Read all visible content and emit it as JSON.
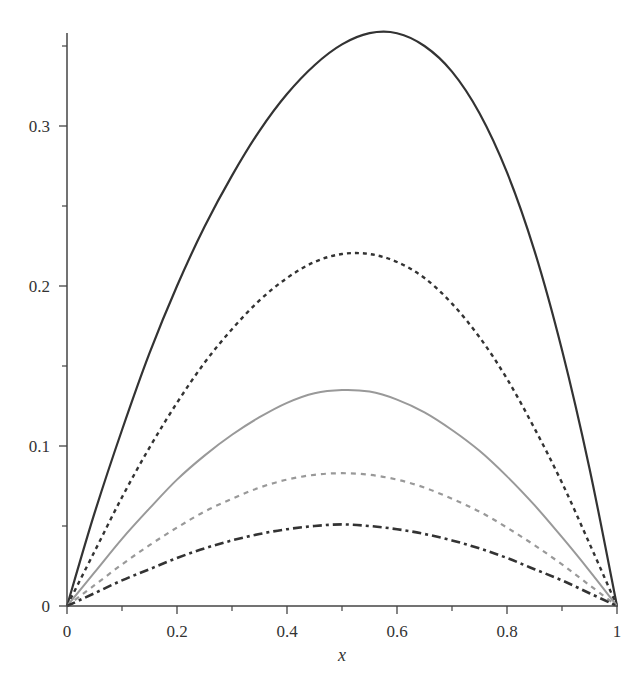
{
  "chart_data": {
    "type": "line",
    "title": "",
    "xlabel": "x",
    "ylabel": "",
    "xlim": [
      0,
      1
    ],
    "ylim": [
      0,
      0.36
    ],
    "grid": false,
    "legend": null,
    "x_ticks": [
      0,
      0.2,
      0.4,
      0.6,
      0.8,
      1
    ],
    "x_tick_labels": [
      "0",
      "0.2",
      "0.4",
      "0.6",
      "0.8",
      "1"
    ],
    "x_minor_ticks": [
      0.1,
      0.3,
      0.5,
      0.7,
      0.9
    ],
    "y_ticks": [
      0,
      0.1,
      0.2,
      0.3
    ],
    "y_tick_labels": [
      "0",
      "0.1",
      "0.2",
      "0.3"
    ],
    "y_minor_ticks": [
      0.05,
      0.15,
      0.25,
      0.35
    ],
    "x": [
      0,
      0.05,
      0.1,
      0.15,
      0.2,
      0.25,
      0.3,
      0.35,
      0.4,
      0.45,
      0.5,
      0.55,
      0.6,
      0.65,
      0.7,
      0.75,
      0.8,
      0.85,
      0.9,
      0.95,
      1
    ],
    "series": [
      {
        "name": "curve-1",
        "style": "solid",
        "color": "#333333",
        "width": 2.2,
        "dash": "",
        "values": [
          0,
          0.058,
          0.11,
          0.158,
          0.2,
          0.237,
          0.269,
          0.297,
          0.32,
          0.338,
          0.351,
          0.358,
          0.358,
          0.35,
          0.334,
          0.308,
          0.271,
          0.222,
          0.16,
          0.086,
          0
        ]
      },
      {
        "name": "curve-2",
        "style": "short-dash",
        "color": "#333333",
        "width": 2.4,
        "dash": "4 4",
        "values": [
          0,
          0.034,
          0.068,
          0.099,
          0.127,
          0.152,
          0.173,
          0.191,
          0.205,
          0.215,
          0.22,
          0.22,
          0.215,
          0.205,
          0.189,
          0.168,
          0.142,
          0.111,
          0.077,
          0.039,
          0
        ]
      },
      {
        "name": "curve-3",
        "style": "solid",
        "color": "#999999",
        "width": 2,
        "dash": "",
        "values": [
          0,
          0.021,
          0.042,
          0.061,
          0.079,
          0.094,
          0.107,
          0.118,
          0.127,
          0.133,
          0.135,
          0.134,
          0.129,
          0.121,
          0.11,
          0.097,
          0.081,
          0.063,
          0.043,
          0.022,
          0
        ]
      },
      {
        "name": "curve-4",
        "style": "dash",
        "color": "#999999",
        "width": 2.2,
        "dash": "5 5",
        "values": [
          0,
          0.013,
          0.026,
          0.038,
          0.049,
          0.059,
          0.067,
          0.074,
          0.079,
          0.082,
          0.083,
          0.082,
          0.079,
          0.074,
          0.067,
          0.059,
          0.049,
          0.038,
          0.026,
          0.013,
          0
        ]
      },
      {
        "name": "curve-5",
        "style": "dash-dot",
        "color": "#333333",
        "width": 2.6,
        "dash": "9 4 3 4",
        "values": [
          0,
          0.008,
          0.016,
          0.023,
          0.03,
          0.036,
          0.041,
          0.045,
          0.048,
          0.05,
          0.051,
          0.05,
          0.048,
          0.045,
          0.041,
          0.036,
          0.03,
          0.023,
          0.016,
          0.008,
          0
        ]
      }
    ]
  }
}
